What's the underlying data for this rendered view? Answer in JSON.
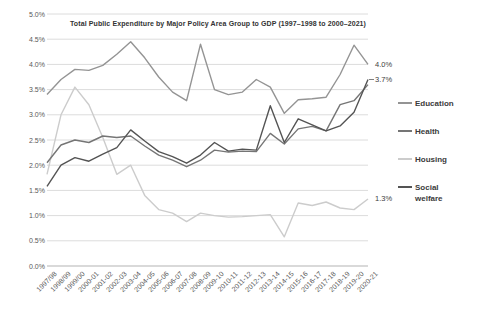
{
  "chart_data": {
    "type": "line",
    "title": "Total Public Expenditure by Major Policy Area Group to GDP  (1997–1998 to 2000–2021)",
    "xlabel": "",
    "ylabel": "",
    "ylim": [
      0,
      5
    ],
    "ytick_step": 0.5,
    "ytick_labels": [
      "0.0%",
      "0.5%",
      "1.0%",
      "1.5%",
      "2.0%",
      "2.5%",
      "3.0%",
      "3.5%",
      "4.0%",
      "4.5%",
      "5.0%"
    ],
    "grid": true,
    "legend_position": "right",
    "categories": [
      "1997/98",
      "1998/99",
      "1999/00",
      "2000-01",
      "2001-02",
      "2002-03",
      "2003-04",
      "2004-05",
      "2005-06",
      "2006-07",
      "2007-08",
      "2008-09",
      "2009-10",
      "2010-11",
      "2011-12",
      "2012-13",
      "2013-14",
      "2014-15",
      "2015-16",
      "2016-17",
      "2017-18",
      "2018-19",
      "2019-20",
      "2020-21"
    ],
    "series": [
      {
        "name": "Education",
        "color": "#949494",
        "end_label": "4.0%",
        "end_label_tick": false,
        "values": [
          3.4,
          3.7,
          3.9,
          3.88,
          3.98,
          4.2,
          4.45,
          4.13,
          3.75,
          3.45,
          3.28,
          4.4,
          3.5,
          3.4,
          3.45,
          3.7,
          3.55,
          3.03,
          3.3,
          3.32,
          3.35,
          3.8,
          4.38,
          4.0
        ]
      },
      {
        "name": "Health",
        "color": "#757575",
        "end_label": "",
        "end_label_tick": false,
        "values": [
          2.05,
          2.4,
          2.5,
          2.45,
          2.58,
          2.55,
          2.58,
          2.38,
          2.2,
          2.1,
          1.97,
          2.1,
          2.3,
          2.26,
          2.28,
          2.27,
          2.63,
          2.42,
          2.72,
          2.77,
          2.68,
          3.2,
          3.28,
          3.6
        ]
      },
      {
        "name": "Housing",
        "color": "#cccccc",
        "end_label": "1.3%",
        "end_label_tick": false,
        "values": [
          1.82,
          3.0,
          3.55,
          3.2,
          2.55,
          1.82,
          2.0,
          1.4,
          1.12,
          1.05,
          0.88,
          1.05,
          1.0,
          0.97,
          0.98,
          1.0,
          1.02,
          0.58,
          1.25,
          1.2,
          1.27,
          1.15,
          1.12,
          1.33
        ]
      },
      {
        "name": "Social welfare",
        "color": "#545454",
        "end_label": "3.7%",
        "end_label_tick": true,
        "values": [
          1.58,
          2.0,
          2.15,
          2.08,
          2.22,
          2.35,
          2.7,
          2.48,
          2.27,
          2.17,
          2.04,
          2.2,
          2.45,
          2.28,
          2.32,
          2.3,
          3.18,
          2.45,
          2.92,
          2.8,
          2.68,
          2.78,
          3.05,
          3.7
        ]
      }
    ]
  }
}
